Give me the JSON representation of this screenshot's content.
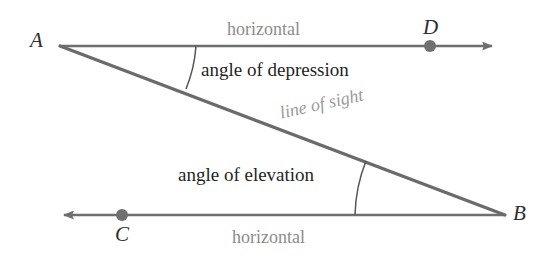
{
  "diagram": {
    "colors": {
      "line_stroke": "#6e6e6e",
      "sight_stroke": "#6b6b6b",
      "arc_stroke": "#555555",
      "dot_fill": "#707070",
      "label_dark": "#1f1f1f",
      "label_gray": "#8c8c8c",
      "background": "#ffffff"
    },
    "points": [
      {
        "id": "A",
        "label": "A",
        "x": 60,
        "y": 46,
        "role": "upper-observer-vertex"
      },
      {
        "id": "B",
        "label": "B",
        "x": 505,
        "y": 215,
        "role": "lower-observer-vertex"
      },
      {
        "id": "C",
        "label": "C",
        "x": 122,
        "y": 215,
        "role": "lower-horizontal-marker"
      },
      {
        "id": "D",
        "label": "D",
        "x": 430,
        "y": 46,
        "role": "upper-horizontal-marker"
      }
    ],
    "labels": {
      "point_a": "A",
      "point_b": "B",
      "point_c": "C",
      "point_d": "D",
      "horizontal_top": "horizontal",
      "horizontal_bottom": "horizontal",
      "angle_of_depression": "angle of depression",
      "angle_of_elevation": "angle of elevation",
      "line_of_sight": "line of sight"
    },
    "segments": [
      {
        "name": "top-horizontal-ray",
        "from": [
          60,
          46
        ],
        "to": [
          500,
          46
        ],
        "arrow": "end-right"
      },
      {
        "name": "bottom-horizontal-ray",
        "from": [
          505,
          215
        ],
        "to": [
          55,
          215
        ],
        "arrow": "end-left"
      },
      {
        "name": "line-of-sight",
        "from": [
          60,
          46
        ],
        "to": [
          505,
          215
        ],
        "arrow": "none"
      }
    ],
    "arcs": [
      {
        "name": "depression-arc",
        "vertex": "A",
        "from": [
          196,
          46
        ],
        "to": [
          186,
          88
        ]
      },
      {
        "name": "elevation-arc",
        "vertex": "B",
        "from": [
          355,
          215
        ],
        "to": [
          365,
          162
        ]
      }
    ]
  }
}
